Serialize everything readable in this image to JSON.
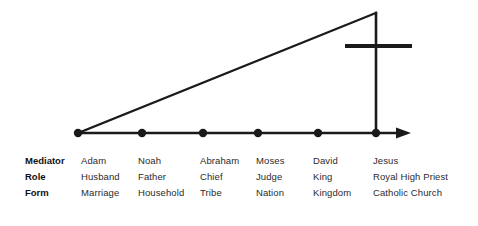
{
  "figure": {
    "background_color": "#ffffff",
    "stroke_color": "#1a1a1a",
    "text_color": "#2b2b2b",
    "heading_color": "#111111"
  },
  "diagram": {
    "axis": {
      "name": "time-axis",
      "x_start": 78,
      "x_end": 410,
      "y": 133,
      "has_arrowhead": true
    },
    "ascent_line": {
      "name": "ascending-development-line",
      "from_x": 78,
      "from_y": 133,
      "to_x": 376,
      "to_y": 13
    },
    "vertical_line": {
      "name": "covenant-fulfillment-vertical",
      "x": 376,
      "y_top": 13,
      "y_bottom": 133
    },
    "cross": {
      "name": "cross-symbol",
      "post_x": 376,
      "post_y_top": 13,
      "post_y_bottom": 133,
      "bar_y": 46,
      "bar_x_start": 345,
      "bar_x_end": 412
    },
    "points": [
      {
        "name": "point-adam",
        "x": 78,
        "y": 133
      },
      {
        "name": "point-noah",
        "x": 142,
        "y": 133
      },
      {
        "name": "point-abraham",
        "x": 203,
        "y": 133
      },
      {
        "name": "point-moses",
        "x": 258,
        "y": 133
      },
      {
        "name": "point-david",
        "x": 318,
        "y": 133
      },
      {
        "name": "point-jesus",
        "x": 376,
        "y": 133
      }
    ]
  },
  "table": {
    "row_headers": [
      "Mediator",
      "Role",
      "Form"
    ],
    "column_x": [
      81,
      138,
      200,
      256,
      313,
      373
    ],
    "row_y": [
      161,
      177,
      193
    ],
    "header_x": 25,
    "rows": {
      "mediator": [
        "Adam",
        "Noah",
        "Abraham",
        "Moses",
        "David",
        "Jesus"
      ],
      "role": [
        "Husband",
        "Father",
        "Chief",
        "Judge",
        "King",
        "Royal High Priest"
      ],
      "form": [
        "Marriage",
        "Household",
        "Tribe",
        "Nation",
        "Kingdom",
        "Catholic Church"
      ]
    }
  }
}
